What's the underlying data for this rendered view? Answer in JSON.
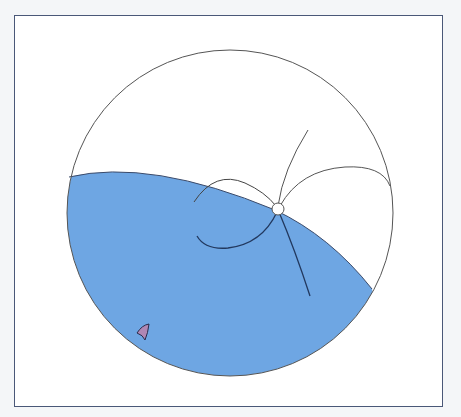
{
  "diagram": {
    "type": "stereonet",
    "colors": {
      "frame": "#4a5878",
      "background": "#ffffff",
      "page": "#f4f6f8",
      "fill": "#6ea6e3",
      "outline": "#555555",
      "curve_dark": "#22385e",
      "marker": "#b087b4"
    },
    "elements": [
      "primitive-circle",
      "shaded-region",
      "great-circles",
      "pole-point",
      "small-marker"
    ]
  }
}
